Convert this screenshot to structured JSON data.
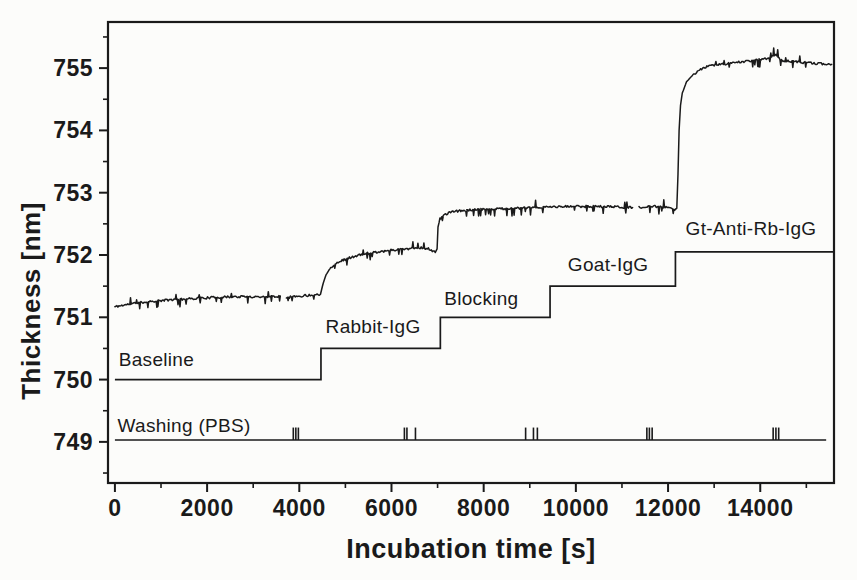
{
  "figure": {
    "paper_color": "#fcfcfa",
    "ink_color": "#1a1a1a"
  },
  "chart_data": {
    "type": "line",
    "title": "",
    "xlabel": "Incubation time [s]",
    "ylabel": "Thickness [nm]",
    "xlim": [
      -150,
      15600
    ],
    "ylim": [
      748.34,
      755.74
    ],
    "x_major_ticks": [
      0,
      2000,
      4000,
      6000,
      8000,
      10000,
      12000,
      14000
    ],
    "x_minor_ticks": [
      1000,
      3000,
      5000,
      7000,
      9000,
      11000,
      13000,
      15000
    ],
    "y_major_ticks": [
      749,
      750,
      751,
      752,
      753,
      754,
      755
    ],
    "y_minor_ticks": [
      748.5,
      749.5,
      750.5,
      751.5,
      752.5,
      753.5,
      754.5,
      755.5
    ],
    "grid": false,
    "legend": null,
    "noise": {
      "seed": 11,
      "jitter": 0.018,
      "spike_prob": 0.12,
      "spike_min": 0.05,
      "spike_max": 0.12,
      "spike_down_bias": 0.72,
      "sample_step": 22,
      "slope_threshold": 0.0008
    },
    "series": {
      "trace": {
        "name": "measured-thickness",
        "segments": [
          [
            [
              0,
              751.17
            ],
            [
              300,
              751.21
            ],
            [
              700,
              751.25
            ],
            [
              1200,
              751.28
            ],
            [
              1900,
              751.31
            ],
            [
              2600,
              751.33
            ],
            [
              3200,
              751.33
            ],
            [
              3580,
              751.34
            ]
          ],
          [
            [
              3720,
              751.32
            ],
            [
              4000,
              751.34
            ],
            [
              4300,
              751.36
            ],
            [
              4460,
              751.37
            ],
            [
              4520,
              751.55
            ],
            [
              4580,
              751.68
            ],
            [
              4660,
              751.78
            ],
            [
              4780,
              751.86
            ],
            [
              4950,
              751.92
            ],
            [
              5200,
              751.98
            ],
            [
              5500,
              752.03
            ],
            [
              5900,
              752.07
            ],
            [
              6300,
              752.1
            ],
            [
              6600,
              752.12
            ],
            [
              6800,
              752.1
            ],
            [
              6950,
              752.04
            ],
            [
              6990,
              752.1
            ],
            [
              7010,
              752.45
            ],
            [
              7050,
              752.58
            ],
            [
              7150,
              752.65
            ],
            [
              7350,
              752.7
            ],
            [
              7700,
              752.72
            ],
            [
              8200,
              752.74
            ],
            [
              8800,
              752.75
            ],
            [
              9400,
              752.77
            ],
            [
              10000,
              752.78
            ],
            [
              10600,
              752.78
            ],
            [
              11000,
              752.77
            ],
            [
              11230,
              752.76
            ]
          ],
          [
            [
              11370,
              752.76
            ],
            [
              11700,
              752.78
            ],
            [
              12000,
              752.76
            ],
            [
              12120,
              752.72
            ],
            [
              12190,
              752.75
            ],
            [
              12215,
              753.3
            ],
            [
              12240,
              754.0
            ],
            [
              12270,
              754.4
            ],
            [
              12310,
              754.6
            ],
            [
              12400,
              754.78
            ],
            [
              12550,
              754.9
            ],
            [
              12750,
              755.0
            ],
            [
              13000,
              755.05
            ],
            [
              13400,
              755.08
            ],
            [
              13800,
              755.12
            ],
            [
              14150,
              755.15
            ],
            [
              14320,
              755.22
            ],
            [
              14450,
              755.12
            ],
            [
              14800,
              755.1
            ],
            [
              15100,
              755.08
            ],
            [
              15550,
              755.06
            ]
          ]
        ]
      },
      "protocol_steps": {
        "name": "incubation-protocol",
        "steps": [
          {
            "label": "Baseline",
            "start": 0,
            "end": 4470,
            "level": 750.0,
            "label_t": 900,
            "label_v": 750.33
          },
          {
            "label": "Rabbit-IgG",
            "start": 4470,
            "end": 7060,
            "level": 750.5,
            "label_t": 5600,
            "label_v": 750.85
          },
          {
            "label": "Blocking",
            "start": 7060,
            "end": 9440,
            "level": 751.0,
            "label_t": 7950,
            "label_v": 751.3
          },
          {
            "label": "Goat-IgG",
            "start": 9440,
            "end": 12160,
            "level": 751.5,
            "label_t": 10700,
            "label_v": 751.85
          },
          {
            "label": "Gt-Anti-Rb-IgG",
            "start": 12160,
            "end": 15600,
            "level": 752.05,
            "label_t": 13800,
            "label_v": 752.42
          }
        ]
      },
      "washing": {
        "name": "washing-events",
        "label": "Washing (PBS)",
        "level": 749.03,
        "start": 0,
        "end": 15430,
        "label_t": 1500,
        "label_v": 749.27,
        "tick_height": 0.2,
        "event_times": [
          3870,
          3925,
          3980,
          6280,
          6335,
          6520,
          8910,
          9080,
          9165,
          11540,
          11595,
          11655,
          14280,
          14340,
          14400
        ]
      }
    }
  }
}
